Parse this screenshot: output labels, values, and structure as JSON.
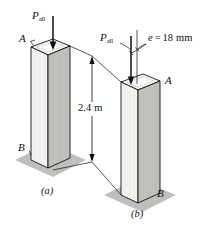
{
  "figure": {
    "type": "engineering-illustration",
    "background_color": "#ffffff",
    "line_color": "#101010",
    "face_light_color": "#f2f2f0",
    "face_mid_color": "#e2e2e0",
    "face_dark_color": "#b9b9b6",
    "shadow_color": "#b4b4b1"
  },
  "load_labels": {
    "left_symbol": "P",
    "left_subscript": "all",
    "right_symbol": "P",
    "right_subscript": "all"
  },
  "eccentricity": {
    "variable": "e",
    "equals": "=",
    "value": "18",
    "unit": "mm",
    "text": "e = 18 mm"
  },
  "dimension": {
    "value": "2.4",
    "unit": "m",
    "text": "2.4 m"
  },
  "points": {
    "left_top": "A",
    "left_bottom": "B",
    "right_top": "A",
    "right_bottom": "B"
  },
  "captions": {
    "left": "(a)",
    "right": "(b)"
  }
}
